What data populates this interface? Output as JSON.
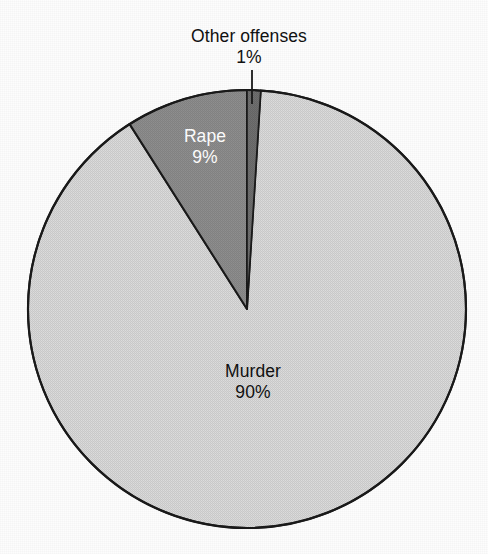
{
  "chart_data": {
    "type": "pie",
    "title": "",
    "subtitle": "",
    "xlabel": "",
    "ylabel": "",
    "legend_position": "none",
    "grid": false,
    "units": "percent",
    "total": 100,
    "categories": [
      "Other offenses",
      "Murder",
      "Rape"
    ],
    "values": [
      1,
      90,
      9
    ],
    "slices": [
      {
        "label": "Other offenses",
        "value": 1,
        "value_text": "1%",
        "color": "#6d6d6d",
        "label_color": "#111111",
        "label_placement": "outside-top",
        "has_leader_line": true,
        "start_angle_deg": 0,
        "end_angle_deg": 3.6
      },
      {
        "label": "Murder",
        "value": 90,
        "value_text": "90%",
        "color": "#d6d6d6",
        "label_color": "#111111",
        "label_placement": "inside",
        "has_leader_line": false,
        "start_angle_deg": 3.6,
        "end_angle_deg": 327.6
      },
      {
        "label": "Rape",
        "value": 9,
        "value_text": "9%",
        "color": "#8b8b8b",
        "label_color": "#ffffff",
        "label_placement": "inside",
        "has_leader_line": false,
        "start_angle_deg": 327.6,
        "end_angle_deg": 360
      }
    ]
  },
  "figure": {
    "background_color": "#fdfdfd",
    "outline_color": "#1a1a1a",
    "center_x": 247,
    "center_y": 309,
    "radius": 219
  },
  "labels": {
    "other": {
      "name": "Other offenses",
      "pct": "1%"
    },
    "rape": {
      "name": "Rape",
      "pct": "9%"
    },
    "murder": {
      "name": "Murder",
      "pct": "90%"
    }
  }
}
